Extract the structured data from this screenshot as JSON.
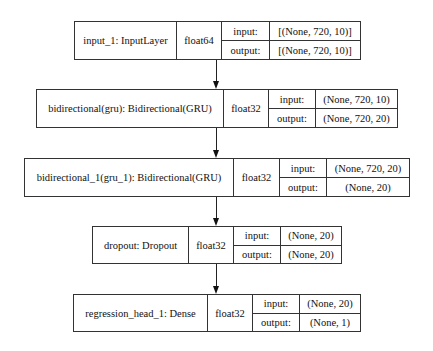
{
  "diagram": {
    "type": "keras-model-plot",
    "nodes": [
      {
        "id": "input_1",
        "label": "input_1: InputLayer",
        "dtype": "float64",
        "input_label": "input:",
        "output_label": "output:",
        "input_shape": "[(None, 720, 10)]",
        "output_shape": "[(None, 720, 10)]"
      },
      {
        "id": "bidirectional",
        "label": "bidirectional(gru): Bidirectional(GRU)",
        "dtype": "float32",
        "input_label": "input:",
        "output_label": "output:",
        "input_shape": "(None, 720, 10)",
        "output_shape": "(None, 720, 20)"
      },
      {
        "id": "bidirectional_1",
        "label": "bidirectional_1(gru_1): Bidirectional(GRU)",
        "dtype": "float32",
        "input_label": "input:",
        "output_label": "output:",
        "input_shape": "(None, 720, 20)",
        "output_shape": "(None, 20)"
      },
      {
        "id": "dropout",
        "label": "dropout: Dropout",
        "dtype": "float32",
        "input_label": "input:",
        "output_label": "output:",
        "input_shape": "(None, 20)",
        "output_shape": "(None, 20)"
      },
      {
        "id": "regression_head_1",
        "label": "regression_head_1: Dense",
        "dtype": "float32",
        "input_label": "input:",
        "output_label": "output:",
        "input_shape": "(None, 20)",
        "output_shape": "(None, 1)"
      }
    ],
    "edges": [
      {
        "from": "input_1",
        "to": "bidirectional"
      },
      {
        "from": "bidirectional",
        "to": "bidirectional_1"
      },
      {
        "from": "bidirectional_1",
        "to": "dropout"
      },
      {
        "from": "dropout",
        "to": "regression_head_1"
      }
    ]
  }
}
